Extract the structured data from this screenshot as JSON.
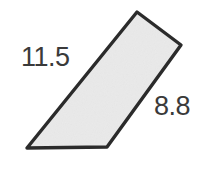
{
  "figure": {
    "type": "geometry-diagram",
    "shape_name": "parallelogram",
    "background_color": "#ffffff",
    "fill_color": "#efefef",
    "stroke_color": "#2b2b2b",
    "stroke_width": 3,
    "text_color": "#3a3a3a",
    "vertices": [
      {
        "name": "top",
        "x": 137,
        "y": 12
      },
      {
        "name": "right",
        "x": 181,
        "y": 45
      },
      {
        "name": "bottom-right",
        "x": 107,
        "y": 147
      },
      {
        "name": "bottom-left",
        "x": 27,
        "y": 148
      }
    ],
    "polygon_points": "137,12 181,45 107,147 27,148",
    "labels": [
      {
        "id": "long-side",
        "text": "11.5",
        "side": "bottom-left-to-top",
        "position": "upper-left"
      },
      {
        "id": "short-side",
        "text": "8.8",
        "side": "right-to-bottom-right",
        "position": "right"
      }
    ]
  }
}
